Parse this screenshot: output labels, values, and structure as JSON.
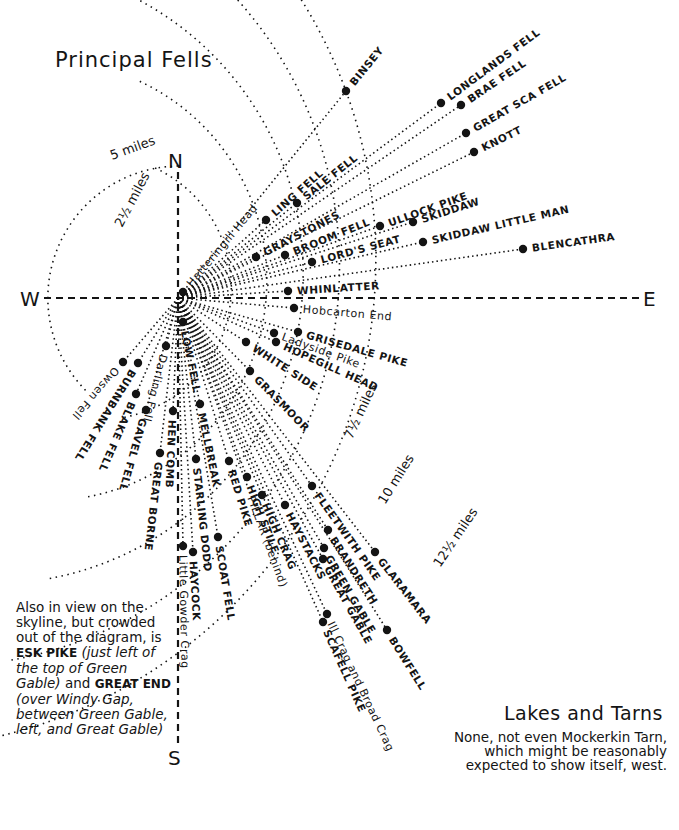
{
  "title": "Principal Fells",
  "compass": {
    "north": "N",
    "south": "S",
    "east": "E",
    "west": "W"
  },
  "center": {
    "x": 178,
    "y": 298
  },
  "distance_rings": [
    {
      "label": "2½ miles",
      "radius": 132,
      "label_x": 122,
      "label_y": 228,
      "label_rot": -62
    },
    {
      "label": "5 miles",
      "radius": 220,
      "label_x": 112,
      "label_y": 160,
      "label_rot": -20
    },
    {
      "label": "7½ miles",
      "radius": 310,
      "label_x": 352,
      "label_y": 440,
      "label_rot": -65
    },
    {
      "label": "10 miles",
      "radius": 400,
      "label_x": 385,
      "label_y": 505,
      "label_rot": -58
    },
    {
      "label": "12½ miles",
      "radius": 490,
      "label_x": 440,
      "label_y": 568,
      "label_rot": -56
    }
  ],
  "fells": [
    {
      "name": "BINSEY",
      "x": 346,
      "y": 91,
      "caps": true
    },
    {
      "name": "LONGLANDS FELL",
      "x": 441,
      "y": 103,
      "caps": true
    },
    {
      "name": "BRAE FELL",
      "x": 461,
      "y": 105,
      "caps": true
    },
    {
      "name": "GREAT SCA FELL",
      "x": 466,
      "y": 133,
      "caps": true
    },
    {
      "name": "KNOTT",
      "x": 474,
      "y": 152,
      "caps": true
    },
    {
      "name": "LING FELL",
      "x": 266,
      "y": 220,
      "caps": true
    },
    {
      "name": "SALE FELL",
      "x": 297,
      "y": 203,
      "caps": true
    },
    {
      "name": "GRAYSTONES",
      "x": 256,
      "y": 257,
      "caps": true
    },
    {
      "name": "BROOM FELL",
      "x": 285,
      "y": 255,
      "caps": true
    },
    {
      "name": "ULLOCK PIKE",
      "x": 380,
      "y": 226,
      "caps": true
    },
    {
      "name": "SKIDDAW",
      "x": 413,
      "y": 222,
      "caps": true
    },
    {
      "name": "LORD'S SEAT",
      "x": 312,
      "y": 262,
      "caps": true
    },
    {
      "name": "SKIDDAW LITTLE MAN",
      "x": 423,
      "y": 242,
      "caps": true
    },
    {
      "name": "BLENCATHRA",
      "x": 523,
      "y": 249,
      "caps": true
    },
    {
      "name": "Hatteringill Head",
      "x": 183,
      "y": 292,
      "caps": false
    },
    {
      "name": "WHINLATTER",
      "x": 288,
      "y": 291,
      "caps": true
    },
    {
      "name": "Hobcarton End",
      "x": 294,
      "y": 308,
      "caps": false
    },
    {
      "name": "GRISEDALE PIKE",
      "x": 298,
      "y": 332,
      "caps": true
    },
    {
      "name": "Ladyside Pike",
      "x": 274,
      "y": 333,
      "caps": false
    },
    {
      "name": "HOPEGILL HEAD",
      "x": 276,
      "y": 342,
      "caps": true
    },
    {
      "name": "WHITE SIDE",
      "x": 246,
      "y": 342,
      "caps": true
    },
    {
      "name": "GRASMOOR",
      "x": 250,
      "y": 371,
      "caps": true
    },
    {
      "name": "Owsen Fell",
      "x": 123,
      "y": 362,
      "caps": false
    },
    {
      "name": "BURNBANK FELL",
      "x": 138,
      "y": 363,
      "caps": true
    },
    {
      "name": "BLAKE FELL",
      "x": 136,
      "y": 394,
      "caps": true
    },
    {
      "name": "Darling Fell",
      "x": 166,
      "y": 346,
      "caps": false
    },
    {
      "name": "GAVEL FELL",
      "x": 146,
      "y": 410,
      "caps": true
    },
    {
      "name": "LOW FELL",
      "x": 183,
      "y": 322,
      "caps": true
    },
    {
      "name": "HEN COMB",
      "x": 173,
      "y": 411,
      "caps": true
    },
    {
      "name": "GREAT BORNE",
      "x": 160,
      "y": 453,
      "caps": true
    },
    {
      "name": "MELLBREAK",
      "x": 200,
      "y": 404,
      "caps": true
    },
    {
      "name": "STARLING DODD",
      "x": 196,
      "y": 459,
      "caps": true
    },
    {
      "name": "RED PIKE",
      "x": 229,
      "y": 461,
      "caps": true
    },
    {
      "name": "HIGH STILE",
      "x": 247,
      "y": 477,
      "caps": true
    },
    {
      "name": "HIGH CRAG",
      "x": 262,
      "y": 495,
      "caps": true
    },
    {
      "name": "HAYSTACKS",
      "x": 285,
      "y": 505,
      "caps": true
    },
    {
      "name": "FLEETWITH PIKE",
      "x": 312,
      "y": 486,
      "caps": true
    },
    {
      "name": "BRANDRETH",
      "x": 328,
      "y": 530,
      "caps": true
    },
    {
      "name": "GREEN GABLE",
      "x": 324,
      "y": 548,
      "caps": true
    },
    {
      "name": "GREAT GABLE",
      "x": 323,
      "y": 559,
      "caps": true
    },
    {
      "name": "GLARAMARA",
      "x": 375,
      "y": 552,
      "caps": true
    },
    {
      "name": "Ill Crag and Broad Crag",
      "x": 327,
      "y": 614,
      "caps": false
    },
    {
      "name": "SCAFELL PIKE",
      "x": 323,
      "y": 622,
      "caps": true
    },
    {
      "name": "BOWFELL",
      "x": 387,
      "y": 630,
      "caps": true
    },
    {
      "name": "SCOAT FELL",
      "x": 218,
      "y": 537,
      "caps": true
    },
    {
      "name": "PILLAR (behind)",
      "x": 248,
      "y": 488,
      "caps": false,
      "no_dot": true
    },
    {
      "name": "HAYCOCK",
      "x": 193,
      "y": 552,
      "caps": true
    },
    {
      "name": "Little Gowder Crag",
      "x": 183,
      "y": 546,
      "caps": false
    }
  ],
  "note": {
    "intro": "Also in view on the skyline, but crowded out of the diagram, is",
    "fell1": "ESK PIKE",
    "fell1_desc": "(just left of the top of Green Gable)",
    "conj": "and",
    "fell2": "GREAT END",
    "fell2_desc": "(over Windy Gap, between Green Gable, left, and Great Gable)"
  },
  "lakes": {
    "heading": "Lakes and Tarns",
    "text": "None, not even Mockerkin Tarn, which might be reasonably expected to show itself, west."
  },
  "colors": {
    "ink": "#141414",
    "paper": "#ffffff"
  }
}
